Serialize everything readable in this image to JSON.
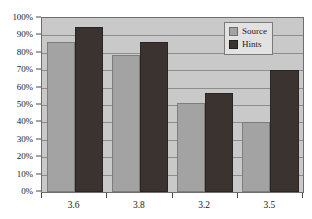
{
  "chart_data": {
    "type": "bar",
    "title": "",
    "xlabel": "",
    "ylabel": "",
    "categories": [
      "3.6",
      "3.8",
      "3.2",
      "3.5"
    ],
    "series": [
      {
        "name": "Source",
        "color": "#a3a3a3",
        "values": [
          86,
          79,
          51,
          40
        ]
      },
      {
        "name": "Hints",
        "color": "#3a3330",
        "values": [
          95,
          86,
          57,
          70
        ]
      }
    ],
    "ylim": [
      0,
      100
    ],
    "ytick_values": [
      0,
      10,
      20,
      30,
      40,
      50,
      60,
      70,
      80,
      90,
      100
    ],
    "ytick_labels": [
      "0%",
      "10%",
      "20%",
      "30%",
      "40%",
      "50%",
      "60%",
      "70%",
      "80%",
      "90%",
      "100%"
    ],
    "grid": true,
    "grid_axis": "y",
    "legend_position": "top-right",
    "plot_background": "#c9c9c9",
    "figure_background": "#ffffff"
  },
  "legend": {
    "entries": [
      {
        "label": "Source",
        "swatch": "source-swatch"
      },
      {
        "label": "Hints",
        "swatch": "hints-swatch"
      }
    ]
  }
}
